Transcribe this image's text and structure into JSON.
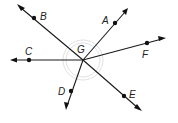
{
  "diagram": {
    "center": {
      "label": "G",
      "x": 83,
      "y": 60
    },
    "rays": [
      {
        "name": "B",
        "label": "B",
        "point": [
          34,
          18
        ],
        "tip": [
          18,
          5
        ],
        "label_pos": [
          40,
          20
        ]
      },
      {
        "name": "A",
        "label": "A",
        "point": [
          115,
          23
        ],
        "tip": [
          127,
          9
        ],
        "label_pos": [
          102,
          24
        ]
      },
      {
        "name": "F",
        "label": "F",
        "point": [
          147,
          43
        ],
        "tip": [
          165,
          38
        ],
        "label_pos": [
          142,
          58
        ]
      },
      {
        "name": "C",
        "label": "C",
        "point": [
          29,
          60
        ],
        "tip": [
          11,
          60
        ],
        "label_pos": [
          25,
          55
        ]
      },
      {
        "name": "D",
        "label": "D",
        "point": [
          71,
          91
        ],
        "tip": [
          66,
          109
        ],
        "label_pos": [
          58,
          95
        ]
      },
      {
        "name": "E",
        "label": "E",
        "point": [
          124,
          96
        ],
        "tip": [
          141,
          110
        ],
        "label_pos": [
          129,
          98
        ]
      }
    ],
    "labels": {
      "A": "A",
      "B": "B",
      "C": "C",
      "D": "D",
      "E": "E",
      "F": "F",
      "G": "G"
    },
    "colors": {
      "line": "#1a1a1a",
      "point": "#111111",
      "arc": "#d8d8d8"
    }
  }
}
